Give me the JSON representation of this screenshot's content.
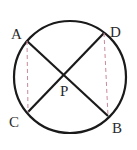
{
  "diagram": {
    "type": "geometry",
    "circle": {
      "cx": 70,
      "cy": 77,
      "r": 56,
      "stroke": "#1a1a1a"
    },
    "points": {
      "A": {
        "x": 27,
        "y": 41,
        "label": "A",
        "lx": 11,
        "ly": 39
      },
      "D": {
        "x": 104,
        "y": 33,
        "label": "D",
        "lx": 110,
        "ly": 37
      },
      "C": {
        "x": 28,
        "y": 112,
        "label": "C",
        "lx": 9,
        "ly": 127
      },
      "B": {
        "x": 108,
        "y": 116,
        "label": "B",
        "lx": 112,
        "ly": 133
      },
      "P": {
        "x": 66,
        "y": 75,
        "label": "P",
        "lx": 60,
        "ly": 96
      }
    },
    "solid_chords": [
      "AB",
      "CD"
    ],
    "dashed_segments": [
      "AC",
      "DB"
    ],
    "dashed_color": "#c98a98"
  }
}
